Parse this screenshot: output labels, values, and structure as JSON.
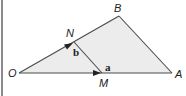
{
  "diagram": {
    "type": "vector-triangle",
    "points": {
      "O": {
        "label": "O",
        "x": 19,
        "y": 73
      },
      "A": {
        "label": "A",
        "x": 172,
        "y": 73
      },
      "B": {
        "label": "B",
        "x": 119,
        "y": 16
      },
      "N": {
        "label": "N",
        "x": 74,
        "y": 42
      },
      "M": {
        "label": "M",
        "x": 102,
        "y": 73
      }
    },
    "vectors": {
      "a": {
        "label": "a",
        "from": "O",
        "to": "M"
      },
      "b": {
        "label": "b",
        "from": "O",
        "to": "N"
      }
    },
    "segments": [
      "OA",
      "OB",
      "AB",
      "NM"
    ],
    "colors": {
      "fill": "#ececec",
      "stroke": "#4a4a4a",
      "left_rule": "#8a8a8a"
    }
  }
}
